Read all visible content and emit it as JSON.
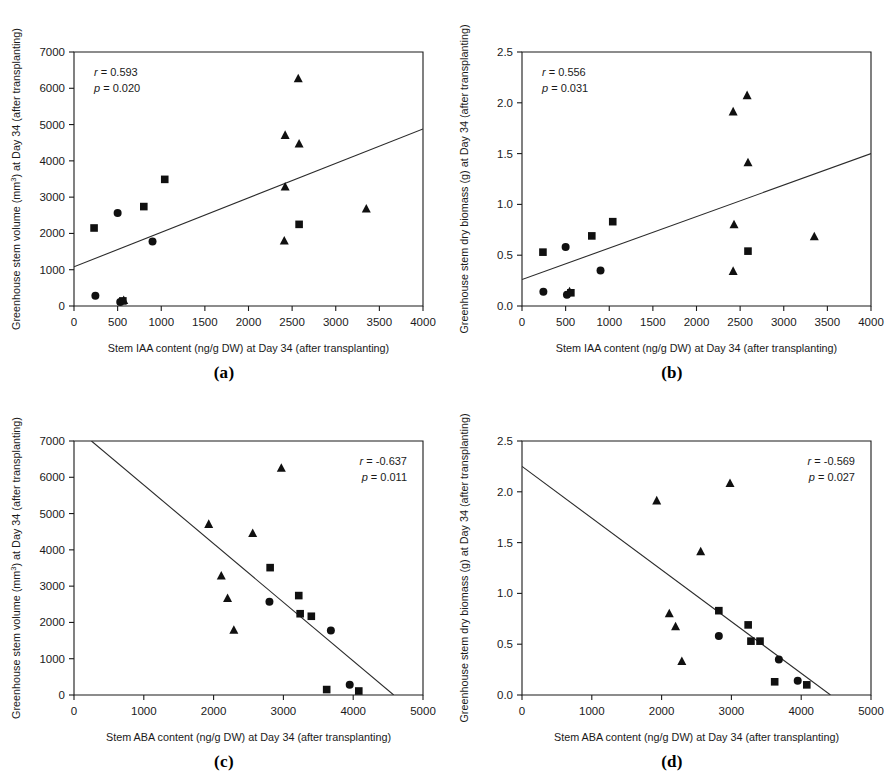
{
  "figure": {
    "panels": [
      {
        "letter": "(a)",
        "xlabel": "Stem IAA content (ng/g DW) at Day 34 (after transplanting)",
        "ylabel": "Greenhouse stem volume (mm³) at Day 34 (after transplanting)",
        "r_text": "r = 0.593",
        "p_text": "p = 0.020",
        "stat_pos": "left"
      },
      {
        "letter": "(b)",
        "xlabel": "Stem IAA content (ng/g DW) at Day 34 (after transplanting)",
        "ylabel": "Greenhouse stem dry biomass (g) at Day 34 (after transplanting)",
        "r_text": "r = 0.556",
        "p_text": "p = 0.031",
        "stat_pos": "left"
      },
      {
        "letter": "(c)",
        "xlabel": "Stem ABA content (ng/g DW) at Day 34 (after transplanting)",
        "ylabel": "Greenhouse stem volume (mm³) at Day 34 (after transplanting)",
        "r_text": "r = -0.637",
        "p_text": "p = 0.011",
        "stat_pos": "right"
      },
      {
        "letter": "(d)",
        "xlabel": "Stem ABA content (ng/g DW) at Day 34 (after transplanting)",
        "ylabel": "Greenhouse stem dry biomass (g) at Day 34 (after transplanting)",
        "r_text": "r = -0.569",
        "p_text": "p = 0.027",
        "stat_pos": "right"
      }
    ]
  },
  "chart_data": [
    {
      "type": "scatter",
      "panel": "a",
      "title": "",
      "xlabel": "Stem IAA content (ng/g DW) at Day 34 (after transplanting)",
      "ylabel": "Greenhouse stem volume (mm3) at Day 34 (after transplanting)",
      "xlim": [
        0,
        4000
      ],
      "ylim": [
        0,
        7000
      ],
      "xticks": [
        0,
        500,
        1000,
        1500,
        2000,
        2500,
        3000,
        3500,
        4000
      ],
      "yticks": [
        0,
        1000,
        2000,
        3000,
        4000,
        5000,
        6000,
        7000
      ],
      "grid": false,
      "legend": "none",
      "annotations": [
        "r = 0.593",
        "p = 0.020"
      ],
      "correlation_r": 0.593,
      "p_value": 0.02,
      "trendline": {
        "x0": 0,
        "y0": 1080,
        "x1": 4000,
        "y1": 4880
      },
      "series": [
        {
          "name": "square",
          "marker": "square",
          "points": [
            [
              230,
              2150
            ],
            [
              800,
              2740
            ],
            [
              1040,
              3490
            ],
            [
              2580,
              2250
            ],
            [
              560,
              140
            ]
          ]
        },
        {
          "name": "circle",
          "marker": "circle",
          "points": [
            [
              500,
              2560
            ],
            [
              900,
              1780
            ],
            [
              245,
              285
            ],
            [
              530,
              110
            ]
          ]
        },
        {
          "name": "triangle",
          "marker": "triangle",
          "points": [
            [
              2570,
              6260
            ],
            [
              2420,
              4700
            ],
            [
              2580,
              4460
            ],
            [
              2420,
              3280
            ],
            [
              3350,
              2670
            ],
            [
              2410,
              1790
            ],
            [
              570,
              150
            ]
          ]
        }
      ]
    },
    {
      "type": "scatter",
      "panel": "b",
      "title": "",
      "xlabel": "Stem IAA content (ng/g DW) at Day 34 (after transplanting)",
      "ylabel": "Greenhouse stem dry biomass (g) at Day 34 (after transplanting)",
      "xlim": [
        0,
        4000
      ],
      "ylim": [
        0.0,
        2.5
      ],
      "xticks": [
        0,
        500,
        1000,
        1500,
        2000,
        2500,
        3000,
        3500,
        4000
      ],
      "yticks": [
        0.0,
        0.5,
        1.0,
        1.5,
        2.0,
        2.5
      ],
      "grid": false,
      "legend": "none",
      "annotations": [
        "r = 0.556",
        "p = 0.031"
      ],
      "correlation_r": 0.556,
      "p_value": 0.031,
      "trendline": {
        "x0": 0,
        "y0": 0.26,
        "x1": 4000,
        "y1": 1.5
      },
      "series": [
        {
          "name": "square",
          "marker": "square",
          "points": [
            [
              240,
              0.53
            ],
            [
              800,
              0.69
            ],
            [
              1040,
              0.83
            ],
            [
              2590,
              0.54
            ],
            [
              560,
              0.13
            ]
          ]
        },
        {
          "name": "circle",
          "marker": "circle",
          "points": [
            [
              500,
              0.58
            ],
            [
              900,
              0.35
            ],
            [
              245,
              0.14
            ],
            [
              515,
              0.11
            ]
          ]
        },
        {
          "name": "triangle",
          "marker": "triangle",
          "points": [
            [
              2580,
              2.07
            ],
            [
              2420,
              1.91
            ],
            [
              2590,
              1.41
            ],
            [
              2430,
              0.8
            ],
            [
              3350,
              0.68
            ],
            [
              2420,
              0.34
            ],
            [
              545,
              0.14
            ]
          ]
        }
      ]
    },
    {
      "type": "scatter",
      "panel": "c",
      "title": "",
      "xlabel": "Stem ABA content (ng/g DW) at Day 34 (after transplanting)",
      "ylabel": "Greenhouse stem volume (mm3) at Day 34 (after transplanting)",
      "xlim": [
        0,
        5000
      ],
      "ylim": [
        0,
        7000
      ],
      "xticks": [
        0,
        1000,
        2000,
        3000,
        4000,
        5000
      ],
      "yticks": [
        0,
        1000,
        2000,
        3000,
        4000,
        5000,
        6000,
        7000
      ],
      "grid": false,
      "legend": "none",
      "annotations": [
        "r = -0.637",
        "p = 0.011"
      ],
      "correlation_r": -0.637,
      "p_value": 0.011,
      "trendline": {
        "x0": 250,
        "y0": 7000,
        "x1": 4580,
        "y1": 0
      },
      "series": [
        {
          "name": "square",
          "marker": "square",
          "points": [
            [
              2810,
              3510
            ],
            [
              3220,
              2740
            ],
            [
              3240,
              2240
            ],
            [
              3400,
              2170
            ],
            [
              3620,
              150
            ],
            [
              4080,
              110
            ]
          ]
        },
        {
          "name": "circle",
          "marker": "circle",
          "points": [
            [
              2800,
              2570
            ],
            [
              3680,
              1780
            ],
            [
              3950,
              280
            ]
          ]
        },
        {
          "name": "triangle",
          "marker": "triangle",
          "points": [
            [
              2970,
              6250
            ],
            [
              1930,
              4700
            ],
            [
              2560,
              4450
            ],
            [
              2110,
              3280
            ],
            [
              2200,
              2660
            ],
            [
              2290,
              1780
            ]
          ]
        }
      ]
    },
    {
      "type": "scatter",
      "panel": "d",
      "title": "",
      "xlabel": "Stem ABA content (ng/g DW) at Day 34 (after transplanting)",
      "ylabel": "Greenhouse stem dry biomass (g) at Day 34 (after transplanting)",
      "xlim": [
        0,
        5000
      ],
      "ylim": [
        0.0,
        2.5
      ],
      "xticks": [
        0,
        1000,
        2000,
        3000,
        4000,
        5000
      ],
      "yticks": [
        0.0,
        0.5,
        1.0,
        1.5,
        2.0,
        2.5
      ],
      "grid": false,
      "legend": "none",
      "annotations": [
        "r = -0.569",
        "p = 0.027"
      ],
      "correlation_r": -0.569,
      "p_value": 0.027,
      "trendline": {
        "x0": 0,
        "y0": 2.25,
        "x1": 4420,
        "y1": 0
      },
      "series": [
        {
          "name": "square",
          "marker": "square",
          "points": [
            [
              2820,
              0.83
            ],
            [
              3240,
              0.69
            ],
            [
              3280,
              0.53
            ],
            [
              3410,
              0.53
            ],
            [
              3620,
              0.13
            ]
          ]
        },
        {
          "name": "circle",
          "marker": "circle",
          "points": [
            [
              2820,
              0.58
            ],
            [
              3680,
              0.35
            ],
            [
              3950,
              0.14
            ]
          ]
        },
        {
          "name": "triangle",
          "marker": "triangle",
          "points": [
            [
              2980,
              2.08
            ],
            [
              1930,
              1.91
            ],
            [
              2560,
              1.41
            ],
            [
              2110,
              0.8
            ],
            [
              2200,
              0.67
            ],
            [
              2290,
              0.33
            ]
          ]
        },
        {
          "name": "square2",
          "marker": "square",
          "points": [
            [
              4080,
              0.1
            ]
          ]
        }
      ]
    }
  ]
}
